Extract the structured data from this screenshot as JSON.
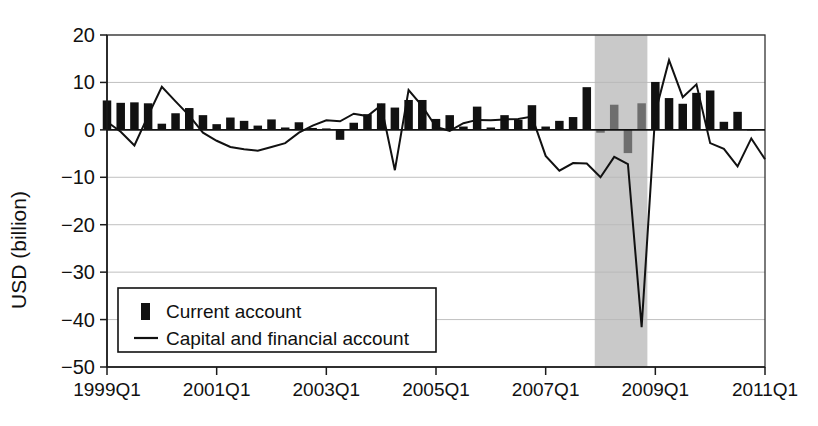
{
  "chart_data": {
    "type": "bar",
    "title": "",
    "xlabel": "",
    "ylabel": "USD (billion)",
    "ylim": [
      -50,
      20
    ],
    "yticks": [
      20,
      10,
      0,
      -10,
      -20,
      -30,
      -40,
      -50
    ],
    "ytick_labels": [
      "20",
      "10",
      "0",
      "−10",
      "−20",
      "−30",
      "−40",
      "−50"
    ],
    "grid": true,
    "legend_position": "lower-left-inside",
    "x_major_labels": [
      "1999Q1",
      "2001Q1",
      "2003Q1",
      "2005Q1",
      "2007Q1",
      "2009Q1",
      "2011Q1"
    ],
    "x_major_index": [
      0,
      8,
      16,
      24,
      32,
      40,
      48
    ],
    "categories": [
      "1999Q1",
      "1999Q2",
      "1999Q3",
      "1999Q4",
      "2000Q1",
      "2000Q2",
      "2000Q3",
      "2000Q4",
      "2001Q1",
      "2001Q2",
      "2001Q3",
      "2001Q4",
      "2002Q1",
      "2002Q2",
      "2002Q3",
      "2002Q4",
      "2003Q1",
      "2003Q2",
      "2003Q3",
      "2003Q4",
      "2004Q1",
      "2004Q2",
      "2004Q3",
      "2004Q4",
      "2005Q1",
      "2005Q2",
      "2005Q3",
      "2005Q4",
      "2006Q1",
      "2006Q2",
      "2006Q3",
      "2006Q4",
      "2007Q1",
      "2007Q2",
      "2007Q3",
      "2007Q4",
      "2008Q1",
      "2008Q2",
      "2008Q3",
      "2008Q4",
      "2009Q1",
      "2009Q2",
      "2009Q3",
      "2009Q4",
      "2010Q1",
      "2010Q2",
      "2010Q3",
      "2010Q4",
      "2011Q1"
    ],
    "series": [
      {
        "name": "Current account",
        "type": "bar",
        "values": [
          6.2,
          5.7,
          5.8,
          5.6,
          1.3,
          3.5,
          4.6,
          3.1,
          1.2,
          2.6,
          1.9,
          0.9,
          2.2,
          0.5,
          1.6,
          0.4,
          0.3,
          -2.1,
          1.5,
          3.3,
          5.6,
          4.7,
          6.3,
          6.3,
          2.3,
          3.1,
          0.7,
          4.9,
          0.5,
          3.1,
          2.1,
          5.2,
          0.7,
          1.9,
          2.7,
          9.0,
          -0.6,
          5.3,
          -4.9,
          5.6,
          10.1,
          6.7,
          5.5,
          7.8,
          8.3,
          1.7,
          3.8,
          0.1,
          0.0
        ]
      },
      {
        "name": "Capital and financial account",
        "type": "line",
        "values": [
          1.7,
          -0.4,
          -3.3,
          3.0,
          9.1,
          6.0,
          3.0,
          -0.6,
          -2.3,
          -3.6,
          -4.1,
          -4.4,
          -3.6,
          -2.8,
          -0.6,
          0.9,
          2.0,
          1.8,
          3.4,
          2.9,
          5.2,
          -8.5,
          8.4,
          5.0,
          0.6,
          -0.2,
          1.4,
          2.1,
          2.0,
          2.2,
          2.3,
          2.8,
          -5.5,
          -8.6,
          -7.0,
          -7.1,
          -10.0,
          -5.7,
          -7.2,
          -41.6,
          3.6,
          14.7,
          6.9,
          9.6,
          -2.8,
          -4.0,
          -7.7,
          -1.8,
          -6.2
        ]
      }
    ],
    "shaded_region": {
      "label": "",
      "start_index": 36,
      "end_index": 39,
      "color": "#c9c9c9"
    }
  },
  "legend": {
    "items": [
      {
        "marker": "bar-marker",
        "label": "Current account"
      },
      {
        "marker": "line-marker",
        "label": "Capital and financial account"
      }
    ]
  },
  "colors": {
    "bar": "#111111",
    "bar_shaded": "#6e6e6e",
    "line": "#111111",
    "grid": "#b9b9b9",
    "shade": "#c9c9c9"
  }
}
